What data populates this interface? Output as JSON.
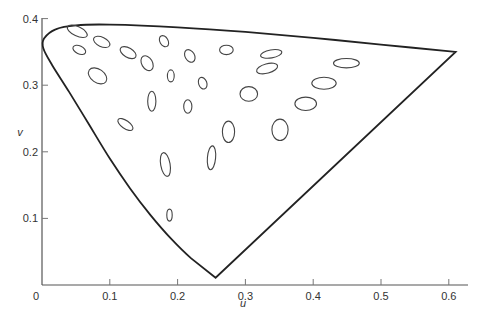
{
  "chart_data": {
    "type": "scatter",
    "title": "",
    "xlabel": "u",
    "ylabel": "v",
    "xlim": [
      0,
      0.63
    ],
    "ylim": [
      0,
      0.4
    ],
    "grid": false,
    "legend": null,
    "x_ticks": [
      "0",
      "0.1",
      "0.2",
      "0.3",
      "0.4",
      "0.5",
      "0.6"
    ],
    "y_ticks": [
      "0.1",
      "0.2",
      "0.3",
      "0.4"
    ],
    "spectral_locus": [
      [
        0.256,
        0.011
      ],
      [
        0.22,
        0.04
      ],
      [
        0.19,
        0.07
      ],
      [
        0.16,
        0.105
      ],
      [
        0.13,
        0.145
      ],
      [
        0.1,
        0.19
      ],
      [
        0.07,
        0.24
      ],
      [
        0.04,
        0.29
      ],
      [
        0.015,
        0.33
      ],
      [
        0.002,
        0.355
      ],
      [
        0.003,
        0.37
      ],
      [
        0.02,
        0.384
      ],
      [
        0.05,
        0.39
      ],
      [
        0.1,
        0.391
      ],
      [
        0.2,
        0.387
      ],
      [
        0.3,
        0.38
      ],
      [
        0.4,
        0.371
      ],
      [
        0.5,
        0.361
      ],
      [
        0.61,
        0.35
      ]
    ],
    "ellipses": [
      {
        "u": 0.052,
        "v": 0.381,
        "a": 0.016,
        "b": 0.007,
        "angle": 25
      },
      {
        "u": 0.055,
        "v": 0.353,
        "a": 0.01,
        "b": 0.006,
        "angle": 25
      },
      {
        "u": 0.088,
        "v": 0.365,
        "a": 0.013,
        "b": 0.007,
        "angle": 25
      },
      {
        "u": 0.127,
        "v": 0.349,
        "a": 0.013,
        "b": 0.007,
        "angle": 30
      },
      {
        "u": 0.155,
        "v": 0.333,
        "a": 0.008,
        "b": 0.012,
        "angle": -30
      },
      {
        "u": 0.18,
        "v": 0.366,
        "a": 0.006,
        "b": 0.009,
        "angle": -30
      },
      {
        "u": 0.19,
        "v": 0.314,
        "a": 0.005,
        "b": 0.009,
        "angle": 0
      },
      {
        "u": 0.082,
        "v": 0.314,
        "a": 0.015,
        "b": 0.01,
        "angle": 35
      },
      {
        "u": 0.218,
        "v": 0.344,
        "a": 0.007,
        "b": 0.01,
        "angle": -30
      },
      {
        "u": 0.272,
        "v": 0.353,
        "a": 0.01,
        "b": 0.007,
        "angle": 0
      },
      {
        "u": 0.338,
        "v": 0.347,
        "a": 0.016,
        "b": 0.006,
        "angle": -10
      },
      {
        "u": 0.332,
        "v": 0.325,
        "a": 0.016,
        "b": 0.007,
        "angle": -15
      },
      {
        "u": 0.237,
        "v": 0.303,
        "a": 0.006,
        "b": 0.009,
        "angle": -20
      },
      {
        "u": 0.449,
        "v": 0.333,
        "a": 0.019,
        "b": 0.007,
        "angle": 0
      },
      {
        "u": 0.416,
        "v": 0.303,
        "a": 0.018,
        "b": 0.009,
        "angle": 0
      },
      {
        "u": 0.389,
        "v": 0.272,
        "a": 0.016,
        "b": 0.01,
        "angle": 0
      },
      {
        "u": 0.305,
        "v": 0.287,
        "a": 0.013,
        "b": 0.011,
        "angle": 0
      },
      {
        "u": 0.351,
        "v": 0.233,
        "a": 0.012,
        "b": 0.016,
        "angle": 0
      },
      {
        "u": 0.162,
        "v": 0.276,
        "a": 0.006,
        "b": 0.015,
        "angle": 0
      },
      {
        "u": 0.215,
        "v": 0.268,
        "a": 0.006,
        "b": 0.01,
        "angle": 0
      },
      {
        "u": 0.123,
        "v": 0.241,
        "a": 0.013,
        "b": 0.006,
        "angle": 35
      },
      {
        "u": 0.275,
        "v": 0.23,
        "a": 0.009,
        "b": 0.016,
        "angle": 0
      },
      {
        "u": 0.182,
        "v": 0.181,
        "a": 0.007,
        "b": 0.018,
        "angle": -10
      },
      {
        "u": 0.25,
        "v": 0.191,
        "a": 0.006,
        "b": 0.018,
        "angle": 5
      },
      {
        "u": 0.188,
        "v": 0.105,
        "a": 0.004,
        "b": 0.009,
        "angle": 0
      }
    ]
  },
  "axes": {
    "x_label": "u",
    "y_label": "v",
    "origin_label": "0"
  }
}
